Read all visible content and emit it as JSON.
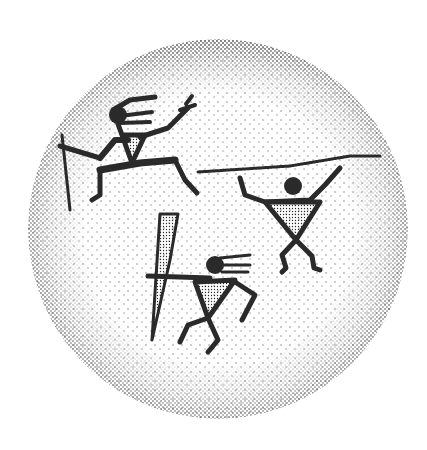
{
  "image": {
    "description": "Stippled ink illustration of rock-art style human figures inside a dotted circle",
    "caption": "Three petroglyph-style figures: a leaping figure with staff, a figure holding a long spear overhead, and a crouching figure with a club",
    "colors": {
      "background": "#ffffff",
      "ink": "#2a2a2a"
    },
    "circle": {
      "cx": 218,
      "cy": 229,
      "r": 190
    },
    "figures": [
      {
        "name": "leaping-figure",
        "holds": "staff"
      },
      {
        "name": "spear-bearer",
        "holds": "long spear overhead"
      },
      {
        "name": "crouching-figure",
        "holds": "club"
      }
    ]
  }
}
